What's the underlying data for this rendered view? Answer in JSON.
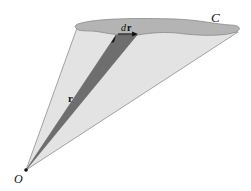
{
  "figure": {
    "labels": {
      "curve": "C",
      "origin": "O",
      "position_vector": "r",
      "differential_d": "d",
      "differential_r": "r"
    },
    "colors": {
      "background": "#ffffff",
      "fan_fill": "#e3e3e3",
      "fan_stroke": "#888888",
      "curve_fill": "#b4b4b4",
      "curve_stroke": "#8a8a8a",
      "sector_fill": "#6e6e6e",
      "point": "#111111"
    }
  }
}
